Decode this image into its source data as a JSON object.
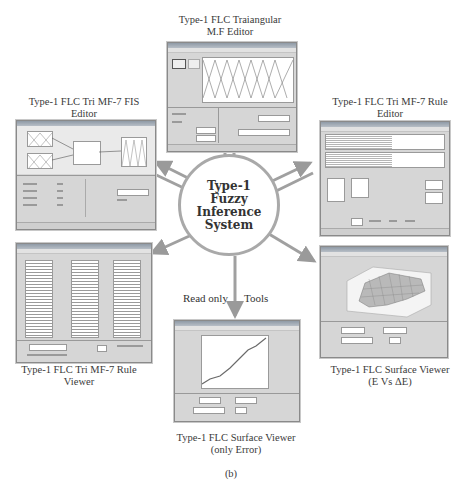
{
  "hub": {
    "lines": [
      "Type-1",
      "Fuzzy",
      "Inference",
      "System"
    ]
  },
  "edge_labels": {
    "read_only": "Read only",
    "tools": "Tools"
  },
  "nodes": {
    "mf_editor": {
      "caption_line1": "Type-1 FLC Traiangular",
      "caption_line2": "M.F Editor"
    },
    "fis_editor": {
      "caption_line1": "Type-1 FLC Tri MF-7 FIS",
      "caption_line2": "Editor"
    },
    "rule_editor": {
      "caption_line1": "Type-1 FLC Tri MF-7 Rule",
      "caption_line2": "Editor"
    },
    "rule_viewer": {
      "caption_line1": "Type-1 FLC Tri MF-7 Rule",
      "caption_line2": "Viewer"
    },
    "surface_viewer_e_de": {
      "caption_line1": "Type-1 FLC Surface Viewer",
      "caption_line2": "(E Vs ΔE)"
    },
    "surface_viewer_error": {
      "caption_line1": "Type-1 FLC Surface Viewer",
      "caption_line2": "(only Error)"
    }
  },
  "figure_label": "(b)",
  "colors": {
    "arrow": "#a0a0a0",
    "window_bg": "#d6d6d6",
    "plot_line": "#6a6a6a"
  }
}
